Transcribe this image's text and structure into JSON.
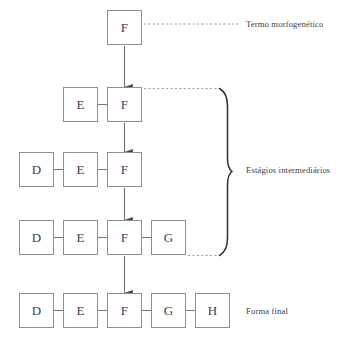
{
  "diagram": {
    "colors": {
      "box_border": "#8e8e8e",
      "box_fill": "#ffffff",
      "connector": "#7a7a7a",
      "arrow": "#4a4a4a",
      "dashed": "#9a9a9a",
      "brace": "#2e2e2e",
      "text": "#3c3c3c",
      "background": "#ffffff"
    },
    "rows": [
      {
        "id": "row-1",
        "nodes": [
          {
            "id": "r1-f",
            "label": "F",
            "x": 107,
            "y": 10
          }
        ]
      },
      {
        "id": "row-2",
        "nodes": [
          {
            "id": "r2-e",
            "label": "E",
            "x": 63,
            "y": 87
          },
          {
            "id": "r2-f",
            "label": "F",
            "x": 107,
            "y": 87
          }
        ]
      },
      {
        "id": "row-3",
        "nodes": [
          {
            "id": "r3-d",
            "label": "D",
            "x": 19,
            "y": 152
          },
          {
            "id": "r3-e",
            "label": "E",
            "x": 63,
            "y": 152
          },
          {
            "id": "r3-f",
            "label": "F",
            "x": 107,
            "y": 152
          }
        ]
      },
      {
        "id": "row-4",
        "nodes": [
          {
            "id": "r4-d",
            "label": "D",
            "x": 19,
            "y": 220
          },
          {
            "id": "r4-e",
            "label": "E",
            "x": 63,
            "y": 220
          },
          {
            "id": "r4-f",
            "label": "F",
            "x": 107,
            "y": 220
          },
          {
            "id": "r4-g",
            "label": "G",
            "x": 151,
            "y": 220
          }
        ]
      },
      {
        "id": "row-5",
        "nodes": [
          {
            "id": "r5-d",
            "label": "D",
            "x": 19,
            "y": 293
          },
          {
            "id": "r5-e",
            "label": "E",
            "x": 63,
            "y": 293
          },
          {
            "id": "r5-f",
            "label": "F",
            "x": 107,
            "y": 293
          },
          {
            "id": "r5-g",
            "label": "G",
            "x": 151,
            "y": 293
          },
          {
            "id": "r5-h",
            "label": "H",
            "x": 195,
            "y": 293
          }
        ]
      }
    ],
    "annotations": {
      "top": {
        "text": "Termo morfogenético",
        "x": 246,
        "y": 15
      },
      "middle": {
        "text": "Estágios intermediários",
        "x": 246,
        "y": 162
      },
      "bottom": {
        "text": "Forma final",
        "x": 246,
        "y": 304
      }
    }
  }
}
